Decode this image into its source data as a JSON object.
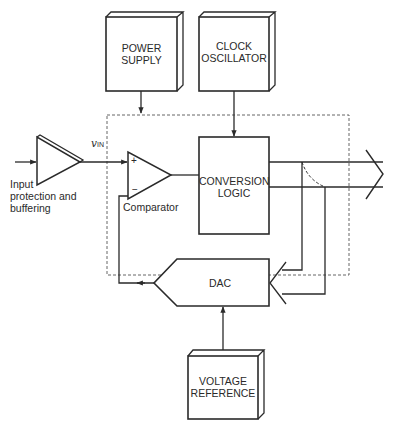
{
  "diagram": {
    "type": "block-diagram",
    "blocks": {
      "power_supply": {
        "line1": "POWER",
        "line2": "SUPPLY"
      },
      "clock_oscillator": {
        "line1": "CLOCK",
        "line2": "OSCILLATOR"
      },
      "conversion_logic": {
        "line1": "CONVERSION",
        "line2": "LOGIC"
      },
      "dac": {
        "label": "DAC"
      },
      "voltage_reference": {
        "line1": "VOLTAGE",
        "line2": "REFERENCE"
      }
    },
    "comparator": {
      "label": "Comparator",
      "plus": "+",
      "minus": "−"
    },
    "input_buffer": {
      "line1": "Input",
      "line2": "protection and",
      "line3": "buffering"
    },
    "signal": {
      "v": "v",
      "sub": "IN"
    },
    "connections": [
      {
        "from": "Input",
        "to": "Input buffer"
      },
      {
        "from": "Input buffer",
        "to": "Comparator +",
        "label": "vIN"
      },
      {
        "from": "Power Supply",
        "to": "Chip boundary"
      },
      {
        "from": "Clock Oscillator",
        "to": "Conversion Logic"
      },
      {
        "from": "Comparator",
        "to": "Conversion Logic"
      },
      {
        "from": "Conversion Logic",
        "to": "Digital output bus"
      },
      {
        "from": "Conversion Logic bus",
        "to": "DAC digital inputs"
      },
      {
        "from": "DAC",
        "to": "Comparator −"
      },
      {
        "from": "Voltage Reference",
        "to": "DAC"
      }
    ]
  }
}
